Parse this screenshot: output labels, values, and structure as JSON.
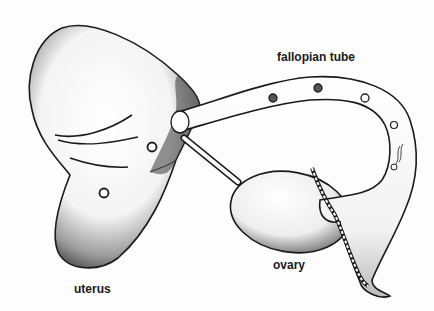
{
  "diagram": {
    "labels": {
      "fallopian_tube": "fallopian tube",
      "uterus": "uterus",
      "ovary": "ovary"
    },
    "colors": {
      "outline": "#1a1a1a",
      "shading": "#555555",
      "fill": "#ffffff",
      "background": "#fdfdfd"
    }
  }
}
